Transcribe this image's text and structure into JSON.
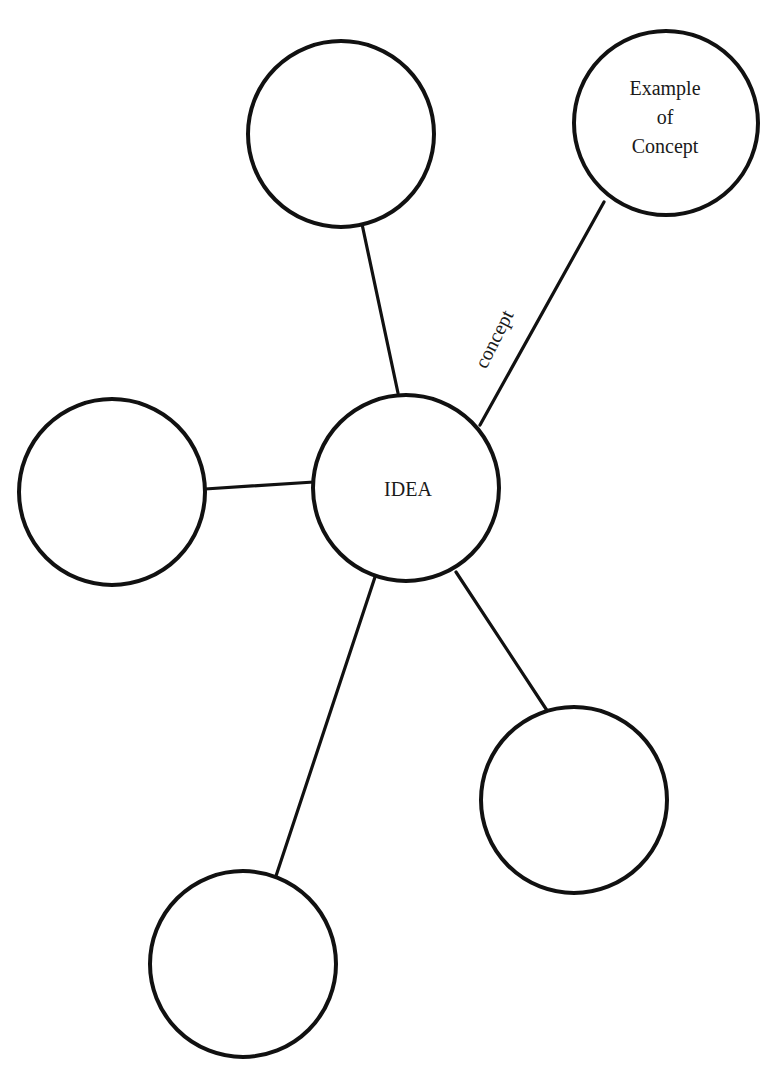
{
  "diagram": {
    "type": "concept-map",
    "center": {
      "id": "idea",
      "label": "IDEA",
      "cx": 406,
      "cy": 488,
      "r": 93
    },
    "nodes": [
      {
        "id": "top",
        "label": "",
        "cx": 341,
        "cy": 134,
        "r": 93
      },
      {
        "id": "example",
        "label_lines": [
          "Example",
          "of",
          "Concept"
        ],
        "cx": 666,
        "cy": 123,
        "r": 92
      },
      {
        "id": "left",
        "label": "",
        "cx": 112,
        "cy": 492,
        "r": 93
      },
      {
        "id": "lower-right",
        "label": "",
        "cx": 574,
        "cy": 800,
        "r": 93
      },
      {
        "id": "bottom",
        "label": "",
        "cx": 243,
        "cy": 964,
        "r": 93
      }
    ],
    "edges": [
      {
        "from": "idea",
        "to": "top",
        "label": ""
      },
      {
        "from": "idea",
        "to": "example",
        "label": "concept"
      },
      {
        "from": "idea",
        "to": "left",
        "label": ""
      },
      {
        "from": "idea",
        "to": "lower-right",
        "label": ""
      },
      {
        "from": "idea",
        "to": "bottom",
        "label": ""
      }
    ],
    "labels": {
      "center": "IDEA",
      "example_line1": "Example",
      "example_line2": "of",
      "example_line3": "Concept",
      "edge_concept": "concept"
    }
  }
}
